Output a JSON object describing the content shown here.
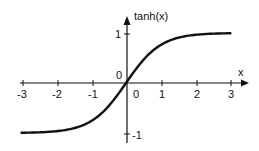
{
  "chart_data": {
    "type": "line",
    "title": "",
    "xlabel": "x",
    "ylabel": "tanh(x)",
    "xlim": [
      -3,
      3
    ],
    "ylim": [
      -1,
      1
    ],
    "grid": false,
    "legend": null,
    "x_ticks": [
      "-3",
      "-2",
      "-1",
      "0",
      "1",
      "2",
      "3"
    ],
    "y_ticks": [
      "1",
      "0",
      "-1"
    ],
    "origin_label": "0",
    "series": [
      {
        "name": "tanh(x)",
        "x": [
          -3,
          -2.5,
          -2,
          -1.5,
          -1,
          -0.5,
          0,
          0.5,
          1,
          1.5,
          2,
          2.5,
          3
        ],
        "y": [
          -0.995,
          -0.987,
          -0.964,
          -0.905,
          -0.762,
          -0.462,
          0,
          0.462,
          0.762,
          0.905,
          0.964,
          0.987,
          0.995
        ]
      }
    ]
  },
  "labels": {
    "ylabel": "tanh(x)",
    "xlabel": "x",
    "origin": "0",
    "xt0": "-3",
    "xt1": "-2",
    "xt2": "-1",
    "xt3": "0",
    "xt4": "1",
    "xt5": "2",
    "xt6": "3",
    "yt_pos": "1",
    "yt_neg": "-1"
  },
  "colors": {
    "line": "#111111",
    "axis": "#111111",
    "background": "#ffffff"
  }
}
